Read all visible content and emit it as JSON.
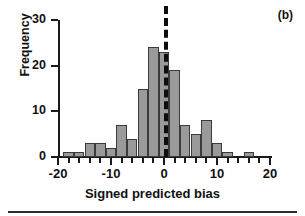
{
  "figure": {
    "panel_label": "(b)"
  },
  "chart_data": {
    "type": "bar",
    "title": "",
    "subtitle": "",
    "xlabel": "Signed predicted bias",
    "ylabel": "Frequency",
    "xlim": [
      -20,
      20
    ],
    "ylim": [
      0,
      30
    ],
    "x_ticks_major": [
      -20,
      -10,
      0,
      10,
      20
    ],
    "x_tick_labels": [
      "-20",
      "-10",
      "0",
      "10",
      "20"
    ],
    "x_ticks_minor_step": 2,
    "y_ticks": [
      0,
      10,
      20,
      30
    ],
    "y_tick_labels": [
      "0",
      "10",
      "20",
      "30"
    ],
    "grid": false,
    "legend": null,
    "bar_width": 2,
    "bin_centers": [
      -18,
      -16,
      -14,
      -12,
      -10,
      -8,
      -6,
      -4,
      -2,
      0,
      2,
      4,
      6,
      8,
      10,
      12,
      14,
      16
    ],
    "categories": [
      "-18",
      "-16",
      "-14",
      "-12",
      "-10",
      "-8",
      "-6",
      "-4",
      "-2",
      "0",
      "2",
      "4",
      "6",
      "8",
      "10",
      "12",
      "14",
      "16"
    ],
    "values": [
      1,
      1,
      3,
      3,
      2,
      7,
      4,
      15,
      24,
      23,
      19,
      7,
      5,
      8,
      3,
      1,
      0,
      1
    ],
    "annotations": [
      {
        "name": "zero-reference-line",
        "type": "vline",
        "x": 0,
        "style": "dashed",
        "color": "#0d0d0d"
      }
    ],
    "colors": {
      "bar_fill": "#9a9a9a",
      "bar_edge": "#3a3a3a",
      "axis": "#1a1a1a",
      "text": "#111111",
      "reference_line": "#0d0d0d"
    }
  }
}
